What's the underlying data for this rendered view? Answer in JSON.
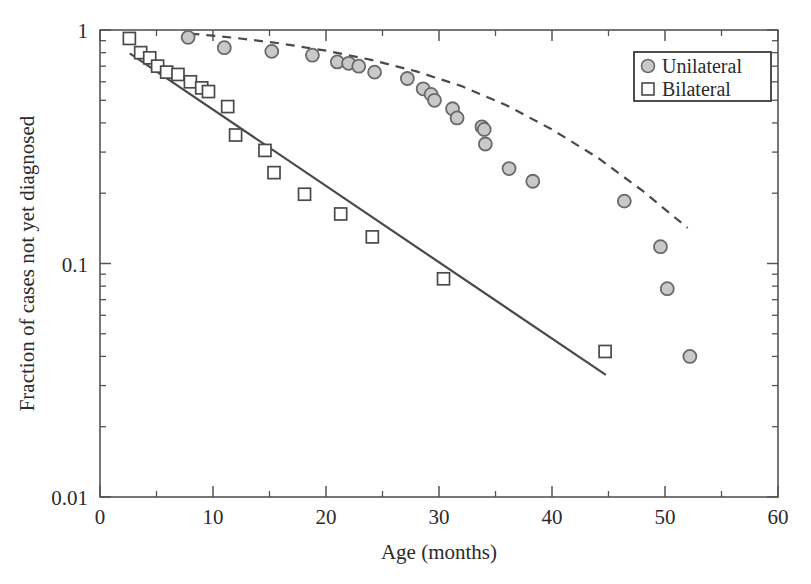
{
  "figure": {
    "background": "#ffffff",
    "frame_color": "#555555",
    "width": 811,
    "height": 584
  },
  "legend": {
    "position": "top-right",
    "border_color": "#3a3a3a",
    "entries": [
      {
        "label": "Unilateral",
        "marker": "circle-filled",
        "fill": "#c9c9c9",
        "stroke": "#6a6a6a"
      },
      {
        "label": "Bilateral",
        "marker": "square-open",
        "fill": "#ffffff",
        "stroke": "#4a4a4a"
      }
    ]
  },
  "chart_data": {
    "type": "scatter",
    "title": "",
    "xlabel": "Age (months)",
    "ylabel": "Fraction of cases not yet diagnosed",
    "xlim": [
      0,
      60
    ],
    "ylim": [
      0.01,
      1
    ],
    "yscale": "log",
    "xscale": "linear",
    "grid": false,
    "legend_position": "top-right",
    "xticks": [
      0,
      10,
      20,
      30,
      40,
      50,
      60
    ],
    "xticklabels": [
      "0",
      "10",
      "20",
      "30",
      "40",
      "50",
      "60"
    ],
    "xminorticks": [
      5,
      15,
      25,
      35,
      45,
      55
    ],
    "yticks": [
      1,
      0.1,
      0.01
    ],
    "yticklabels": [
      "1",
      "0.1",
      "0.01"
    ],
    "yminorticks": [
      0.9,
      0.8,
      0.7,
      0.6,
      0.5,
      0.4,
      0.3,
      0.2,
      0.09,
      0.08,
      0.07,
      0.06,
      0.05,
      0.04,
      0.03,
      0.02
    ],
    "series": [
      {
        "name": "Unilateral",
        "marker": "circle-filled",
        "fill": "#c9c9c9",
        "stroke": "#6a6a6a",
        "marker_size": 13,
        "points": [
          {
            "x": 7.8,
            "y": 0.93
          },
          {
            "x": 11.0,
            "y": 0.84
          },
          {
            "x": 15.2,
            "y": 0.81
          },
          {
            "x": 18.8,
            "y": 0.78
          },
          {
            "x": 21.0,
            "y": 0.73
          },
          {
            "x": 22.0,
            "y": 0.72
          },
          {
            "x": 22.9,
            "y": 0.7
          },
          {
            "x": 24.3,
            "y": 0.66
          },
          {
            "x": 27.2,
            "y": 0.62
          },
          {
            "x": 28.6,
            "y": 0.56
          },
          {
            "x": 29.3,
            "y": 0.53
          },
          {
            "x": 29.6,
            "y": 0.5
          },
          {
            "x": 31.2,
            "y": 0.46
          },
          {
            "x": 31.6,
            "y": 0.42
          },
          {
            "x": 33.8,
            "y": 0.385
          },
          {
            "x": 34.0,
            "y": 0.375
          },
          {
            "x": 34.1,
            "y": 0.325
          },
          {
            "x": 36.2,
            "y": 0.255
          },
          {
            "x": 38.3,
            "y": 0.225
          },
          {
            "x": 46.4,
            "y": 0.185
          },
          {
            "x": 49.6,
            "y": 0.118
          },
          {
            "x": 50.2,
            "y": 0.078
          },
          {
            "x": 52.2,
            "y": 0.04
          }
        ],
        "fit": {
          "style": "dashed",
          "color": "#4a4a4a",
          "description": "curved fit through unilateral points, from x=8 to x=52"
        }
      },
      {
        "name": "Bilateral",
        "marker": "square-open",
        "fill": "#ffffff",
        "stroke": "#4a4a4a",
        "marker_size": 12,
        "points": [
          {
            "x": 2.6,
            "y": 0.92
          },
          {
            "x": 3.6,
            "y": 0.8
          },
          {
            "x": 4.4,
            "y": 0.76
          },
          {
            "x": 5.1,
            "y": 0.7
          },
          {
            "x": 5.9,
            "y": 0.66
          },
          {
            "x": 6.9,
            "y": 0.645
          },
          {
            "x": 8.0,
            "y": 0.6
          },
          {
            "x": 9.0,
            "y": 0.565
          },
          {
            "x": 9.6,
            "y": 0.545
          },
          {
            "x": 11.3,
            "y": 0.47
          },
          {
            "x": 12.0,
            "y": 0.355
          },
          {
            "x": 14.6,
            "y": 0.305
          },
          {
            "x": 15.4,
            "y": 0.245
          },
          {
            "x": 18.1,
            "y": 0.198
          },
          {
            "x": 21.3,
            "y": 0.163
          },
          {
            "x": 24.1,
            "y": 0.13
          },
          {
            "x": 30.4,
            "y": 0.086
          },
          {
            "x": 44.7,
            "y": 0.042
          }
        ],
        "fit": {
          "style": "solid",
          "color": "#4a4a4a",
          "description": "straight fit line on log axis from x=2.7 to x=44.7"
        }
      }
    ]
  }
}
